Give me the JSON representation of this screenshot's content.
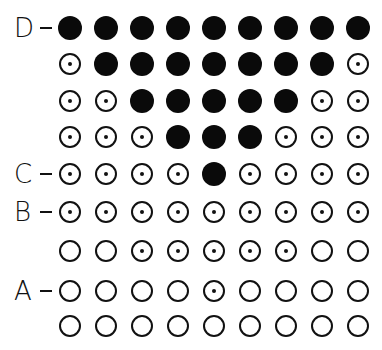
{
  "diagram": {
    "type": "dot-grid",
    "columns": 9,
    "rows": 9,
    "legend": {
      "F": "filled circle",
      "D": "circle with center dot",
      "O": "open circle"
    },
    "row_labels": [
      {
        "row": 0,
        "text": "D"
      },
      {
        "row": 4,
        "text": "C"
      },
      {
        "row": 5,
        "text": "B"
      },
      {
        "row": 7,
        "text": "A"
      }
    ],
    "grid": [
      [
        "F",
        "F",
        "F",
        "F",
        "F",
        "F",
        "F",
        "F",
        "F"
      ],
      [
        "D",
        "F",
        "F",
        "F",
        "F",
        "F",
        "F",
        "F",
        "D"
      ],
      [
        "D",
        "D",
        "F",
        "F",
        "F",
        "F",
        "F",
        "D",
        "D"
      ],
      [
        "D",
        "D",
        "D",
        "F",
        "F",
        "F",
        "D",
        "D",
        "D"
      ],
      [
        "D",
        "D",
        "D",
        "D",
        "F",
        "D",
        "D",
        "D",
        "D"
      ],
      [
        "D",
        "D",
        "D",
        "D",
        "D",
        "D",
        "D",
        "D",
        "D"
      ],
      [
        "O",
        "O",
        "D",
        "D",
        "D",
        "D",
        "D",
        "O",
        "O"
      ],
      [
        "O",
        "O",
        "O",
        "O",
        "D",
        "O",
        "O",
        "O",
        "O"
      ],
      [
        "O",
        "O",
        "O",
        "O",
        "O",
        "O",
        "O",
        "O",
        "O"
      ]
    ],
    "col_x": [
      70,
      106,
      142,
      178,
      214,
      250,
      286,
      322,
      358
    ],
    "row_y": [
      28,
      64,
      101,
      137,
      174,
      212,
      251,
      291,
      326
    ],
    "colors": {
      "ink": "#111111",
      "background": "#ffffff"
    }
  }
}
